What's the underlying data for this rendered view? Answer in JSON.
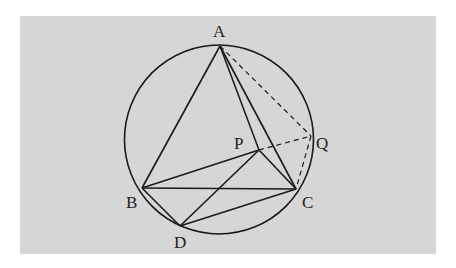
{
  "diagram": {
    "type": "geometry-figure",
    "background": {
      "x": 20,
      "y": 16,
      "width": 416,
      "height": 238,
      "color": "#d6d6d6"
    },
    "stroke_color": "#1a1a1a",
    "circle": {
      "cx": 219,
      "cy": 139.5,
      "r": 94.5
    },
    "points": {
      "A": {
        "x": 220,
        "y": 46
      },
      "B": {
        "x": 142,
        "y": 188
      },
      "C": {
        "x": 296,
        "y": 189
      },
      "D": {
        "x": 180,
        "y": 226
      },
      "P": {
        "x": 259,
        "y": 150
      },
      "Q": {
        "x": 311,
        "y": 136
      }
    },
    "labels": {
      "A": {
        "text": "A",
        "x": 213,
        "y": 37
      },
      "B": {
        "text": "B",
        "x": 126,
        "y": 208
      },
      "C": {
        "text": "C",
        "x": 302,
        "y": 208
      },
      "D": {
        "text": "D",
        "x": 174,
        "y": 248
      },
      "P": {
        "text": "P",
        "x": 234,
        "y": 149
      },
      "Q": {
        "text": "Q",
        "x": 316,
        "y": 149
      }
    },
    "solid_segments": [
      [
        "A",
        "B"
      ],
      [
        "A",
        "C"
      ],
      [
        "A",
        "P"
      ],
      [
        "B",
        "C"
      ],
      [
        "B",
        "P"
      ],
      [
        "P",
        "C"
      ],
      [
        "P",
        "D"
      ],
      [
        "B",
        "D"
      ],
      [
        "D",
        "C"
      ]
    ],
    "dashed_segments": [
      [
        "A",
        "Q"
      ],
      [
        "P",
        "Q"
      ],
      [
        "Q",
        "C"
      ]
    ]
  }
}
